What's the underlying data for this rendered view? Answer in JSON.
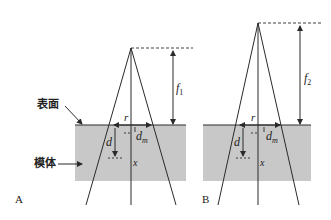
{
  "figure": {
    "type": "beam-geometry-diagram",
    "colors": {
      "phantom_fill": "#c8c8c8",
      "line": "#2a2a2a",
      "background": "#ffffff"
    },
    "annotations": {
      "surface_label": "表面",
      "phantom_label": "模体"
    },
    "panels": [
      {
        "id": "A",
        "panel_label": "A",
        "focal_distance_label": "f",
        "focal_distance_sub": "1",
        "radius_label": "r",
        "depth_label": "d",
        "dmax_label": "d",
        "dmax_sub": "m",
        "point_label": "x"
      },
      {
        "id": "B",
        "panel_label": "B",
        "focal_distance_label": "f",
        "focal_distance_sub": "2",
        "radius_label": "r",
        "depth_label": "d",
        "dmax_label": "d",
        "dmax_sub": "m",
        "point_label": "x"
      }
    ]
  }
}
